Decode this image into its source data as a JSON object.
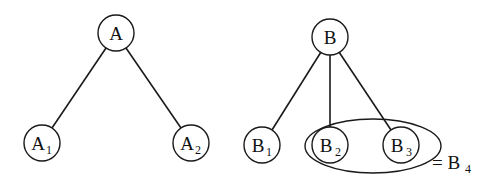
{
  "diagram": {
    "type": "tree-comparison",
    "trees": [
      {
        "root": {
          "id": "A",
          "label": "A",
          "sub": "",
          "cx": 116,
          "cy": 33
        },
        "children": [
          {
            "id": "A1",
            "label": "A",
            "sub": "1",
            "cx": 42,
            "cy": 143
          },
          {
            "id": "A2",
            "label": "A",
            "sub": "2",
            "cx": 191,
            "cy": 143
          }
        ]
      },
      {
        "root": {
          "id": "B",
          "label": "B",
          "sub": "",
          "cx": 330,
          "cy": 37
        },
        "children": [
          {
            "id": "B1",
            "label": "B",
            "sub": "1",
            "cx": 262,
            "cy": 145
          },
          {
            "id": "B2",
            "label": "B",
            "sub": "2",
            "cx": 330,
            "cy": 145
          },
          {
            "id": "B3",
            "label": "B",
            "sub": "3",
            "cx": 401,
            "cy": 145
          }
        ]
      }
    ],
    "grouping": {
      "members": [
        "B2",
        "B3"
      ],
      "equals_label": "= B",
      "equals_sub": "4"
    }
  }
}
